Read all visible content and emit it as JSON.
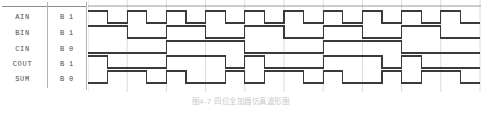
{
  "caption": "图4-7  四位全加器仿真波形图",
  "colors": {
    "signal_line": "#3a3a3a",
    "grid_line": "#dcdcdc",
    "rule_line": "#9a9a9a",
    "text": "#4a4a4a"
  },
  "table": {
    "columns": [
      "name",
      "radix",
      "value"
    ],
    "rows": [
      {
        "name": "AIN",
        "radix": "B",
        "value": "1"
      },
      {
        "name": "BIN",
        "radix": "B",
        "value": "1"
      },
      {
        "name": "CIN",
        "radix": "B",
        "value": "0"
      },
      {
        "name": "COUT",
        "radix": "B",
        "value": "1"
      },
      {
        "name": "SUM",
        "radix": "B",
        "value": "0"
      }
    ]
  },
  "chart_data": {
    "type": "line",
    "title": "四位全加器仿真波形图",
    "xlabel": "",
    "ylabel": "",
    "grid": true,
    "legend_position": "left-table",
    "x_unit_px": 19.6,
    "x_start_px": 0,
    "x_end_px": 393,
    "x_ticks": [
      0,
      2,
      4,
      6,
      8,
      10,
      12,
      14,
      16,
      18,
      20
    ],
    "signals": [
      {
        "name": "AIN",
        "radix": "B",
        "current_value": "1",
        "period_units": 2,
        "initial_level": 1,
        "samples": [
          1,
          0,
          1,
          0,
          1,
          0,
          1,
          0,
          1,
          0,
          1,
          0,
          1,
          0,
          1,
          0,
          1,
          0,
          1,
          0
        ]
      },
      {
        "name": "BIN",
        "radix": "B",
        "current_value": "1",
        "period_units": 4,
        "initial_level": 1,
        "samples": [
          1,
          1,
          0,
          0,
          1,
          1,
          0,
          0,
          1,
          1,
          0,
          0,
          1,
          1,
          0,
          0,
          1,
          1,
          0,
          0
        ]
      },
      {
        "name": "CIN",
        "radix": "B",
        "current_value": "0",
        "period_units": 8,
        "initial_level": 0,
        "samples": [
          0,
          0,
          0,
          0,
          1,
          1,
          1,
          1,
          0,
          0,
          0,
          0,
          1,
          1,
          1,
          1,
          0,
          0,
          0,
          0
        ]
      },
      {
        "name": "COUT",
        "radix": "B",
        "current_value": "1",
        "derivation": "majority(AIN,BIN,CIN)",
        "initial_level": 1,
        "samples": [
          1,
          0,
          0,
          0,
          1,
          1,
          1,
          0,
          1,
          0,
          0,
          0,
          1,
          1,
          1,
          0,
          1,
          0,
          0,
          0
        ]
      },
      {
        "name": "SUM",
        "radix": "B",
        "current_value": "0",
        "derivation": "AIN xor BIN xor CIN",
        "initial_level": 0,
        "samples": [
          0,
          1,
          1,
          0,
          1,
          0,
          0,
          1,
          0,
          1,
          1,
          0,
          1,
          0,
          0,
          1,
          0,
          1,
          1,
          0
        ]
      }
    ]
  }
}
